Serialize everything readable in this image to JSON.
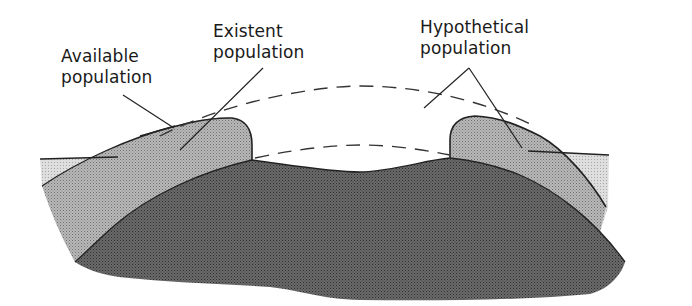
{
  "diagram": {
    "type": "cross-section schematic of population categories",
    "labels": {
      "available": {
        "line1": "Available",
        "line2": "population"
      },
      "existent": {
        "line1": "Existent",
        "line2": "population"
      },
      "hypothetical": {
        "line1": "Hypothetical",
        "line2": "population"
      }
    },
    "regions": [
      {
        "name": "outer-light-band",
        "meaning": "Available population fringe",
        "color": "#d2d2d2"
      },
      {
        "name": "mound-medium",
        "meaning": "Existent population",
        "color": "#a9a9a9"
      },
      {
        "name": "core-dark",
        "meaning": "Base population body",
        "color": "#5e5e5e"
      },
      {
        "name": "dashed-arc",
        "meaning": "Hypothetical population extent",
        "color": "#333333"
      }
    ],
    "colors": {
      "light": "#d4d4d4",
      "medium": "#ababab",
      "dark": "#5f5f5f",
      "outline": "#222222",
      "text": "#1a1a1a"
    }
  }
}
